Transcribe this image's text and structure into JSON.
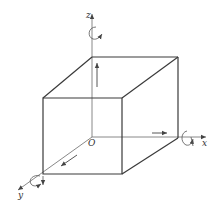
{
  "diagram": {
    "type": "3d-coordinate-cube",
    "labels": {
      "x_axis": "x",
      "y_axis": "y",
      "z_axis": "z",
      "origin": "O"
    },
    "colors": {
      "edge": "#3a3a3a",
      "axis": "#6a6a6a",
      "background": "#ffffff"
    },
    "elements": [
      "cube",
      "x-axis with translation arrow and rotation arrow",
      "y-axis with translation arrow and rotation arrow",
      "z-axis with translation arrow and rotation arrow"
    ]
  }
}
